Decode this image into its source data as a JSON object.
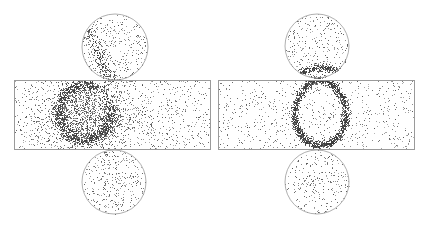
{
  "figure": {
    "width": 427,
    "height": 228,
    "background": "#ffffff",
    "outline_color": "#9a9a9a",
    "dot_color": "#3a3a3a",
    "panels": [
      {
        "name": "left-panel",
        "rect": {
          "x": 14,
          "y": 80,
          "w": 196,
          "h": 69
        },
        "circles": [
          {
            "cx": 115,
            "cy": 47,
            "r": 33
          },
          {
            "cx": 114,
            "cy": 182,
            "r": 32
          }
        ],
        "ring": {
          "cx": 85,
          "cy": 112,
          "rx": 26,
          "ry": 28,
          "thickness": 7,
          "dots": 1400,
          "spread": "diffuse"
        },
        "cloud": {
          "cx": 88,
          "cy": 115,
          "rx": 48,
          "ry": 40,
          "dots": 1500
        },
        "streak": {
          "x1": 86,
          "y1": 28,
          "x2": 112,
          "y2": 82,
          "dots": 260
        },
        "background_dots": {
          "rect": 900,
          "circle": 320
        }
      },
      {
        "name": "right-panel",
        "rect": {
          "x": 218,
          "y": 80,
          "w": 196,
          "h": 69
        },
        "circles": [
          {
            "cx": 317,
            "cy": 46,
            "r": 32
          },
          {
            "cx": 317,
            "cy": 182,
            "r": 32
          }
        ],
        "ring": {
          "cx": 320,
          "cy": 112,
          "rx": 26,
          "ry": 33,
          "thickness": 4,
          "dots": 1600,
          "spread": "tight"
        },
        "arc": {
          "cx": 322,
          "cy": 80,
          "rx": 28,
          "ry": 12,
          "dots": 420
        },
        "background_dots": {
          "rect": 750,
          "circle": 260
        }
      }
    ]
  }
}
